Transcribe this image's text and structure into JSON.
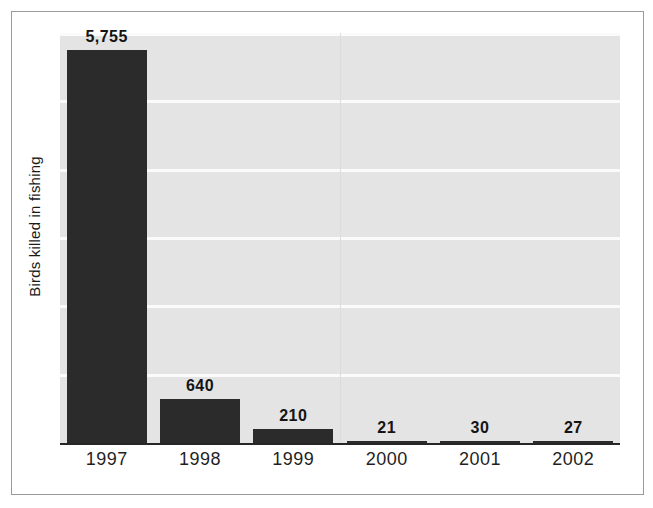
{
  "chart_data": {
    "type": "bar",
    "title": "",
    "subtitle": "",
    "xlabel": "",
    "ylabel": "Birds killed in fishing",
    "categories": [
      "1997",
      "1998",
      "1999",
      "2000",
      "2001",
      "2002"
    ],
    "values": [
      5755,
      640,
      210,
      21,
      30,
      27
    ],
    "value_labels": [
      "5,755",
      "640",
      "210",
      "21",
      "30",
      "27"
    ],
    "series": [
      {
        "name": "Birds killed in fishing",
        "values": [
          5755,
          640,
          210,
          21,
          30,
          27
        ]
      }
    ],
    "ylim": [
      0,
      6000
    ],
    "gridlines": [
      0,
      1000,
      2000,
      3000,
      4000,
      5000,
      6000
    ],
    "grid": true,
    "grid_orientation": "horizontal",
    "y_tick_labels_shown": false,
    "legend": false,
    "legend_position": "none",
    "data_labels": true,
    "colors": {
      "bar": "#2b2b2b",
      "plot_background": "#e4e4e4",
      "gridline": "#fbfbfb",
      "axis_line": "#262626",
      "frame_border": "#9a9a9a",
      "text": "#1a1a1a",
      "figure_background": "#ffffff"
    }
  }
}
